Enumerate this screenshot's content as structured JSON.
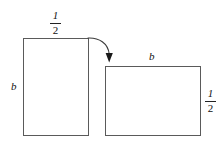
{
  "diagram": {
    "type": "geometry-transformation",
    "background_color": "#ffffff",
    "stroke_color": "#5a5a5a",
    "text_color": "#111111",
    "shapes": [
      {
        "name": "left-rectangle",
        "orientation": "portrait",
        "width_label": {
          "numerator": "1",
          "denominator": "2"
        },
        "height_label": "b"
      },
      {
        "name": "right-rectangle",
        "orientation": "landscape",
        "width_label": "b",
        "height_label": {
          "numerator": "1",
          "denominator": "2"
        }
      }
    ],
    "connector": {
      "name": "curved-arrow",
      "from": "left-rectangle-top-right",
      "to": "right-rectangle-top-left",
      "style": "curved",
      "arrowhead": "filled-triangle-down"
    }
  },
  "labels": {
    "left_rect_width_num": "1",
    "left_rect_width_den": "2",
    "left_rect_height": "b",
    "right_rect_width": "b",
    "right_rect_height_num": "1",
    "right_rect_height_den": "2"
  }
}
